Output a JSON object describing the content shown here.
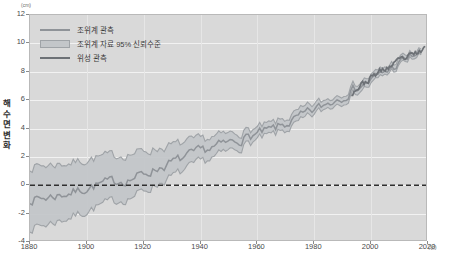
{
  "chart_data": {
    "type": "line",
    "title": "",
    "xlabel": "(년)",
    "ylabel": "해수면 변화",
    "yunit": "(cm)",
    "xlim": [
      1880,
      2020
    ],
    "ylim": [
      -4,
      12
    ],
    "grid": true,
    "legend_position": "top-left",
    "yticks": [
      12,
      10,
      8,
      6,
      4,
      2,
      0,
      -2,
      -4
    ],
    "xticks": [
      1880,
      1900,
      1920,
      1940,
      1960,
      1980,
      2000,
      2020
    ],
    "reference_line": {
      "value": 0,
      "style": "dashed",
      "color": "#2f2f2f"
    },
    "colors": {
      "tide_gauge_line": "#8f9398",
      "confidence_band": "#c3c6c9",
      "band_edge": "#9fa3a7",
      "satellite_line": "#6d7176",
      "panel_background": "#d9d9d9",
      "gridline": "#f2f2f2"
    },
    "series": [
      {
        "name": "조위계 관측",
        "type": "line",
        "x": [
          1880,
          1885,
          1890,
          1895,
          1900,
          1905,
          1910,
          1915,
          1920,
          1925,
          1930,
          1935,
          1940,
          1945,
          1950,
          1955,
          1960,
          1965,
          1970,
          1975,
          1980,
          1985,
          1990,
          1995,
          2000,
          2005,
          2010,
          2015,
          2018
        ],
        "values": [
          -1.0,
          -0.9,
          -0.7,
          -0.5,
          -0.2,
          0.1,
          0.3,
          0.4,
          0.8,
          1.2,
          1.6,
          2.0,
          2.4,
          2.7,
          3.0,
          3.3,
          3.6,
          3.9,
          4.3,
          4.8,
          5.3,
          5.8,
          6.3,
          6.9,
          7.4,
          8.0,
          8.6,
          9.2,
          9.4
        ]
      },
      {
        "name": "조위계 자료 95% 신뢰수준",
        "type": "band",
        "x": [
          1880,
          1885,
          1890,
          1895,
          1900,
          1905,
          1910,
          1915,
          1920,
          1925,
          1930,
          1935,
          1940,
          1945,
          1950,
          1955,
          1960,
          1965,
          1970,
          1975,
          1980,
          1985,
          1990,
          1995,
          2000,
          2005,
          2010,
          2015,
          2018
        ],
        "lower": [
          -3.0,
          -2.8,
          -2.5,
          -2.2,
          -1.8,
          -1.4,
          -1.1,
          -0.9,
          -0.4,
          0.1,
          0.6,
          1.1,
          1.6,
          2.0,
          2.4,
          2.8,
          3.2,
          3.5,
          3.9,
          4.4,
          5.0,
          5.5,
          6.0,
          6.6,
          7.1,
          7.8,
          8.4,
          9.0,
          9.2
        ],
        "upper": [
          1.3,
          1.4,
          1.5,
          1.6,
          1.8,
          2.0,
          2.1,
          2.2,
          2.4,
          2.6,
          2.8,
          3.0,
          3.2,
          3.4,
          3.6,
          3.8,
          4.0,
          4.3,
          4.7,
          5.2,
          5.7,
          6.1,
          6.6,
          7.2,
          7.7,
          8.3,
          8.9,
          9.4,
          9.6
        ]
      },
      {
        "name": "위성 관측",
        "type": "line",
        "x": [
          1993,
          1996,
          1999,
          2002,
          2005,
          2008,
          2011,
          2014,
          2017,
          2019
        ],
        "values": [
          6.5,
          7.0,
          7.4,
          7.9,
          8.2,
          8.5,
          8.9,
          9.1,
          9.4,
          9.6
        ]
      }
    ]
  },
  "legend": {
    "items": [
      {
        "label": "조위계 관측",
        "marker": "line"
      },
      {
        "label": "조위계 자료 95% 신뢰수준",
        "marker": "band"
      },
      {
        "label": "위성 관측",
        "marker": "line-dark"
      }
    ]
  },
  "axis": {
    "y_unit_label": "(cm)",
    "y_axis_title": "해수면 변화",
    "x_unit_label": "(년)",
    "y_tick_labels": [
      "12",
      "10",
      "8",
      "6",
      "4",
      "2",
      "0",
      "-2",
      "-4"
    ],
    "x_tick_labels": [
      "1880",
      "1900",
      "1920",
      "1940",
      "1960",
      "1980",
      "2000",
      "2020"
    ]
  }
}
